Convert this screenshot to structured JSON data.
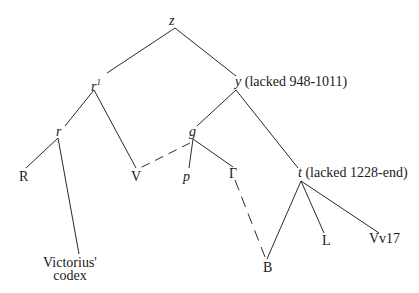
{
  "diagram": {
    "type": "stemma codicum",
    "nodes": {
      "z": {
        "label": "z"
      },
      "r_prime": {
        "label": "r",
        "sup": "1"
      },
      "y": {
        "label": "y",
        "note": "(lacked 948-1011)"
      },
      "r": {
        "label": "r"
      },
      "g": {
        "label": "g"
      },
      "R": {
        "label": "R"
      },
      "V": {
        "label": "V"
      },
      "p": {
        "label": "p"
      },
      "Gamma": {
        "label": "Γ"
      },
      "t": {
        "label": "t",
        "note": "(lacked 1228-end)"
      },
      "L": {
        "label": "L"
      },
      "Vv17": {
        "label": "Vv17"
      },
      "B": {
        "label": "B"
      },
      "victorius": {
        "line1": "Victorius'",
        "line2": "codex"
      }
    },
    "edges": [
      {
        "from": "z",
        "to": "r_prime",
        "style": "solid"
      },
      {
        "from": "z",
        "to": "y",
        "style": "solid"
      },
      {
        "from": "r_prime",
        "to": "r",
        "style": "solid"
      },
      {
        "from": "r_prime",
        "to": "V",
        "style": "solid"
      },
      {
        "from": "r",
        "to": "R",
        "style": "solid"
      },
      {
        "from": "r",
        "to": "victorius",
        "style": "solid"
      },
      {
        "from": "y",
        "to": "g",
        "style": "solid"
      },
      {
        "from": "y",
        "to": "t",
        "style": "solid"
      },
      {
        "from": "g",
        "to": "p",
        "style": "solid"
      },
      {
        "from": "g",
        "to": "Gamma",
        "style": "solid"
      },
      {
        "from": "g",
        "to": "V",
        "style": "dashed"
      },
      {
        "from": "Gamma",
        "to": "B",
        "style": "dashed"
      },
      {
        "from": "t",
        "to": "B",
        "style": "solid"
      },
      {
        "from": "t",
        "to": "L",
        "style": "solid"
      },
      {
        "from": "t",
        "to": "Vv17",
        "style": "solid"
      }
    ],
    "line_color": "#2a2a2a"
  }
}
